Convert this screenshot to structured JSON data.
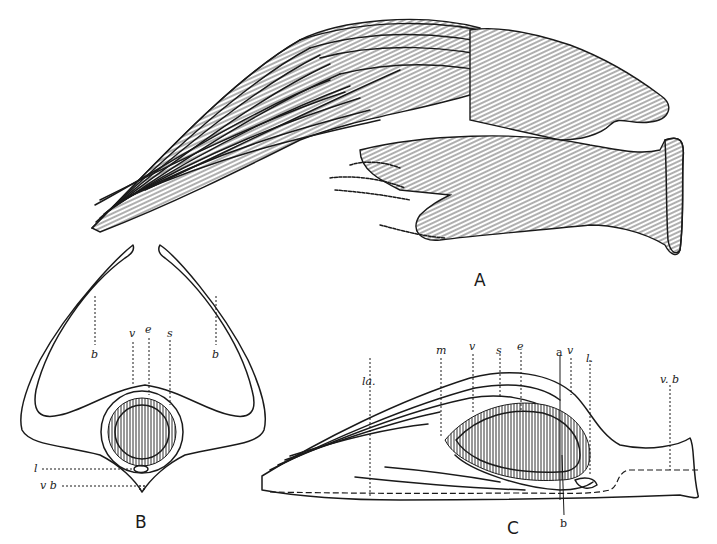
{
  "figure": {
    "panels": [
      {
        "id": "A",
        "letter": "A",
        "description": "External view of specimen with long filamentous strands and hatched body"
      },
      {
        "id": "B",
        "letter": "B",
        "description": "Transverse section",
        "labels": {
          "b_left": "b",
          "b_right": "b",
          "v": "v",
          "e": "e",
          "s": "s",
          "l": "l",
          "vb": "v b"
        }
      },
      {
        "id": "C",
        "letter": "C",
        "description": "Longitudinal section",
        "labels": {
          "la": "la.",
          "m": "m",
          "v1": "v",
          "s": "s",
          "e": "e",
          "a": "a",
          "v2": "v",
          "l": "l.",
          "vb": "v. b",
          "b": "b"
        }
      }
    ]
  },
  "colors": {
    "ink": "#1a1a1a",
    "paper": "#ffffff"
  }
}
